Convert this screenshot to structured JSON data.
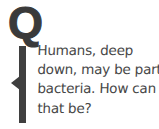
{
  "page": {
    "background_color": "#ffffff",
    "width": 159,
    "height": 129
  },
  "marker": {
    "letter": "Q",
    "meaning": "question-marker",
    "color": "#3a3a3a"
  },
  "quote_bar": {
    "icon": "vertical-bar-with-pointer",
    "color": "#3f3f3f"
  },
  "question": {
    "full_text": "Humans, deep down, may be part bacteria. How can that be?",
    "text_color": "#474747",
    "lines": [
      "Humans, deep",
      "down, may be part",
      "bacteria. How can",
      "that be?"
    ]
  }
}
